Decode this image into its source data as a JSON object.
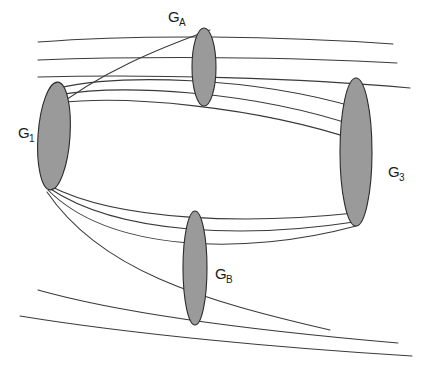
{
  "figure": {
    "title_watermark": "",
    "background_color": "#ffffff",
    "width": 432,
    "height": 366,
    "style": {
      "ellipse_fill": "#9a9a9a",
      "ellipse_stroke": "#2b2b2b",
      "edge_stroke": "#3a3a3a",
      "label_color": "#1a1a1a"
    }
  },
  "nodes": [
    {
      "id": "G1",
      "base": "G",
      "subscript": "1",
      "label_x": 18,
      "label_y": 138,
      "sub_dx": 11,
      "sub_dy": 4,
      "ellipse": {
        "cx": 54,
        "cy": 136,
        "rx": 16,
        "ry": 54,
        "rotate": 4
      }
    },
    {
      "id": "GA",
      "base": "G",
      "subscript": "A",
      "label_x": 168,
      "label_y": 22,
      "sub_dx": 11,
      "sub_dy": 4,
      "ellipse": {
        "cx": 204,
        "cy": 67,
        "rx": 12,
        "ry": 39,
        "rotate": 0
      }
    },
    {
      "id": "G3",
      "base": "G",
      "subscript": "3",
      "label_x": 388,
      "label_y": 177,
      "sub_dx": 11,
      "sub_dy": 4,
      "ellipse": {
        "cx": 356,
        "cy": 152,
        "rx": 16,
        "ry": 74,
        "rotate": 0
      }
    },
    {
      "id": "GB",
      "base": "G",
      "subscript": "B",
      "label_x": 215,
      "label_y": 279,
      "sub_dx": 11,
      "sub_dy": 4,
      "ellipse": {
        "cx": 195,
        "cy": 268,
        "rx": 12,
        "ry": 57,
        "rotate": 0
      }
    }
  ],
  "edges": [
    {
      "name": "top-line-1",
      "d": "M 38 42 C 140 34, 280 36, 393 44"
    },
    {
      "name": "top-line-2",
      "d": "M 38 60 C 150 56, 290 57, 397 63"
    },
    {
      "name": "top-line-3",
      "d": "M 38 77 C 150 74, 300 78, 410 88"
    },
    {
      "name": "g1-over-ga-to-g3-1",
      "d": "M 58 88 C 120 74, 250 76, 358 108"
    },
    {
      "name": "g1-over-ga-to-g3-2",
      "d": "M 57 95 C 120 84, 250 90, 359 127"
    },
    {
      "name": "g1-over-ga-to-g3-3",
      "d": "M 57 103 C 125 95, 255 106, 359 141"
    },
    {
      "name": "ga-down-to-g1",
      "d": "M 210 30 C 160 48, 100 72, 50 112"
    },
    {
      "name": "g1-lower-arc-1",
      "d": "M 50 186 C 120 222, 250 224, 355 213"
    },
    {
      "name": "g1-lower-arc-2",
      "d": "M 49 188 C 120 236, 250 238, 354 222"
    },
    {
      "name": "g1-lower-arc-3",
      "d": "M 48 190 C 110 252, 245 256, 356 226"
    },
    {
      "name": "g1-to-gb-deep",
      "d": "M 47 192 C 100 270, 200 300, 330 330"
    },
    {
      "name": "bottom-line-1",
      "d": "M 38 290 C 130 316, 270 332, 398 343"
    },
    {
      "name": "bottom-line-2",
      "d": "M 20 316 C 130 334, 280 348, 412 356"
    }
  ]
}
